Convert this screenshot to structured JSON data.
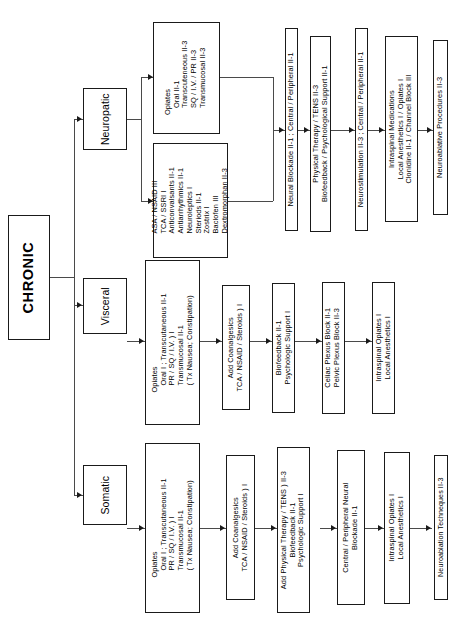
{
  "diagram": {
    "root": {
      "label": "CHRONIC"
    },
    "categories": [
      {
        "id": "neuropatic",
        "label": "Neuropatic"
      },
      {
        "id": "visceral",
        "label": "Visceral"
      },
      {
        "id": "somatic",
        "label": "Somatic"
      }
    ],
    "neuropatic_track": {
      "opiates": {
        "heading": "Opiates",
        "lines": [
          "Oral II-1",
          "Transcuteneous II-3",
          "SQ / I.V. / PR II-3",
          "Transmucosal II-3"
        ]
      },
      "adjuvants": {
        "lines": [
          "ASA / NSAID III",
          "TCA / SSRI I",
          "Anticonvalsants II-1",
          "Antiarrhythmics II-1",
          "Neuroleptics I",
          "Steriods II-1",
          "Zostrix I",
          "Baclofen III",
          "Dextromorphan II-3"
        ]
      },
      "neural_blockade": {
        "lines": [
          "Neural Blockade II-1 ; Central / Peripheral II-1"
        ]
      },
      "physical_therapy": {
        "lines": [
          "Physical Therapy / TENS II-3",
          "Biofeedback / Psychological Support II-1"
        ]
      },
      "neurostimulation": {
        "lines": [
          "Neurostimulation II-3 ; Central / Peripheral II-1"
        ]
      },
      "intraspinal": {
        "lines": [
          "Intraspinal Medications",
          "Local Anesthetics I / Opiates I",
          "Clonidine II-1 / Channel Block III"
        ]
      },
      "neuroablative": {
        "lines": [
          "Neuroablative Procedures II-3"
        ]
      }
    },
    "visceral_track": {
      "opiates": {
        "heading": "Opiates",
        "lines": [
          "Oral I ; Transcutaneous II-1",
          "PR / SQ / I.V. ) I",
          "Transmucosal II-1",
          "( Tx Nausea; Constipation)"
        ]
      },
      "coanalgesics": {
        "lines": [
          "Add Coanalgesics",
          "TCA / NSAID / Steroids ) I"
        ]
      },
      "biofeedback": {
        "lines": [
          "Biofeedback II-1",
          "Psychologic Support I"
        ]
      },
      "plexus_block": {
        "lines": [
          "Celiac Plexus Block II-1",
          "Pelvic Plexus Block II-3"
        ]
      },
      "intraspinal": {
        "lines": [
          "Intraspinal Opiates I",
          "Local Anesthetics I"
        ]
      }
    },
    "somatic_track": {
      "opiates": {
        "heading": "Opiates",
        "lines": [
          "Oral I ; Transcutaneous II-1",
          "PR / SQ / I.V. ) I",
          "Transmucosal II-1",
          "( Tx Nausea; Constipation)"
        ]
      },
      "coanalgesics": {
        "lines": [
          "Add Coanalgesics",
          "TCA / NSAID / Steroids ) I"
        ]
      },
      "physical_therapy": {
        "lines": [
          "Add Physical Therapy / TENS ) II-3",
          "Biofeedback II-1",
          "Psychologic Support I"
        ]
      },
      "neural_blockade": {
        "lines": [
          "Central / Peripheral Neural",
          "Blockade II-1"
        ]
      },
      "intraspinal": {
        "lines": [
          "Intraspinal Opiates I",
          "Local Anesthetics I"
        ]
      },
      "neuroablation": {
        "lines": [
          "Neuroablation Techneques II-3"
        ]
      }
    },
    "colors": {
      "stroke": "#1a1a1a",
      "connector": "#4a4a4a",
      "background": "#ffffff"
    }
  }
}
